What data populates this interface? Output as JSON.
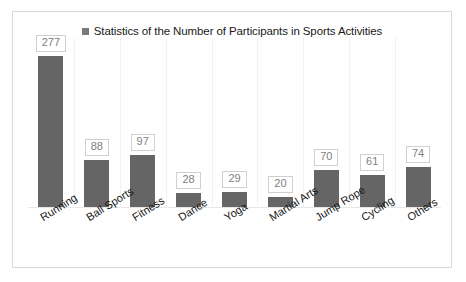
{
  "legend": {
    "marker_icon": "legend-square-icon",
    "marker_color": "#7a7a7a",
    "label": "Statistics of the Number of Participants in Sports Activities"
  },
  "chart_data": {
    "type": "bar",
    "title": "Statistics of the Number of Participants in Sports Activities",
    "xlabel": "",
    "ylabel": "",
    "ylim": [
      0,
      310
    ],
    "grid": "vertical-category-separators",
    "legend_position": "top-center",
    "bar_color": "#656565",
    "data_label_text_color": "#808080",
    "data_label_border_color": "#d0d0d0",
    "categories": [
      "Running",
      "Ball Sports",
      "Fitness",
      "Dance",
      "Yoga",
      "Martial Arts",
      "Jump Rope",
      "Cycling",
      "Others"
    ],
    "values": [
      277,
      88,
      97,
      28,
      29,
      20,
      70,
      61,
      74
    ],
    "labels": [
      "277",
      "88",
      "97",
      "28",
      "29",
      "20",
      "70",
      "61",
      "74"
    ]
  }
}
